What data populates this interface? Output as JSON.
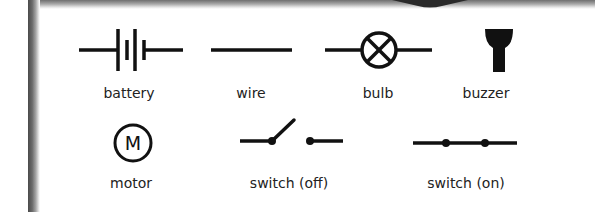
{
  "colors": {
    "symbol": "#111111",
    "label": "#222222",
    "frame_dark": "#4a4a4a",
    "background": "#ffffff"
  },
  "components": [
    {
      "id": "battery",
      "label": "battery",
      "icon": "battery-icon"
    },
    {
      "id": "wire",
      "label": "wire",
      "icon": "wire-icon"
    },
    {
      "id": "bulb",
      "label": "bulb",
      "icon": "bulb-icon"
    },
    {
      "id": "buzzer",
      "label": "buzzer",
      "icon": "buzzer-icon"
    },
    {
      "id": "motor",
      "label": "motor",
      "icon": "motor-icon",
      "glyph": "M"
    },
    {
      "id": "switch-off",
      "label": "switch (off)",
      "icon": "switch-open-icon"
    },
    {
      "id": "switch-on",
      "label": "switch (on)",
      "icon": "switch-closed-icon"
    }
  ]
}
